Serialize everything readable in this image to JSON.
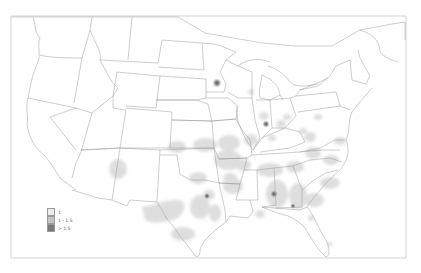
{
  "title": "",
  "legend": {
    "items": [
      {
        "label": "1",
        "color": "#ececec"
      },
      {
        "label": "1 - 1.5",
        "color": "#c4c4c4"
      },
      {
        "label": "> 1.5",
        "color": "#7a7a7a"
      }
    ]
  },
  "colors": {
    "border": "#9a9a9a",
    "frame": "#b5b5b5",
    "low": "#e3e3e3",
    "mid": "#c8c8c8",
    "high": "#6e6e6e"
  }
}
